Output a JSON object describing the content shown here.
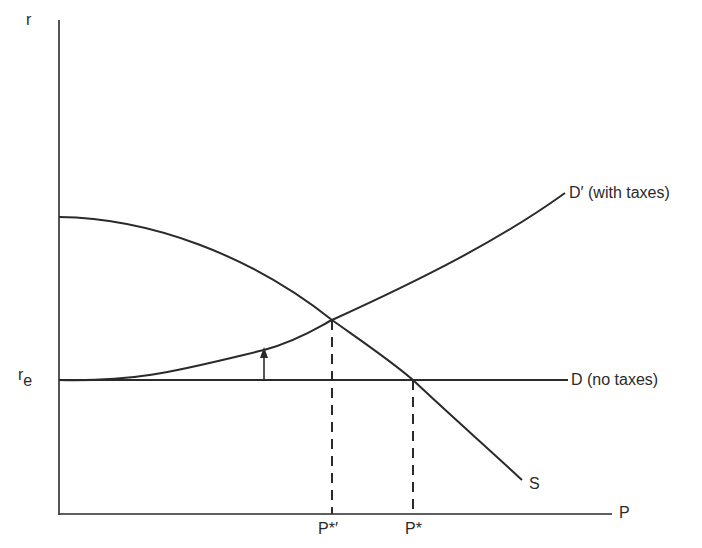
{
  "diagram": {
    "axes": {
      "y_label": "r",
      "x_label": "P"
    },
    "curves": {
      "supply_label": "S",
      "demand_no_tax_label": "D (no taxes)",
      "demand_with_tax_label": "D′ (with taxes)"
    },
    "levels": {
      "re_base": "r",
      "re_sub": "e"
    },
    "equilibria": {
      "with_tax_label": "P*′",
      "no_tax_label": "P*"
    },
    "colors": {
      "line": "#2a2a2a",
      "background": "#ffffff"
    }
  }
}
